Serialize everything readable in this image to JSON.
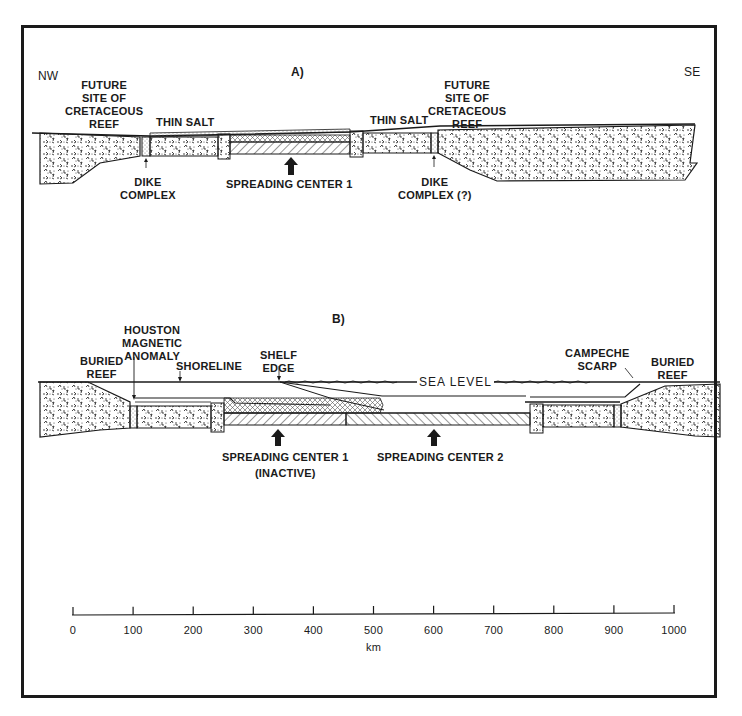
{
  "figure": {
    "orientation": {
      "left": "NW",
      "right": "SE"
    },
    "panel_a": {
      "title": "A)",
      "labels": {
        "reef_left": "FUTURE\nSITE OF\nCRETACEOUS\nREEF",
        "thin_salt_left": "THIN SALT",
        "dike_left": "DIKE\nCOMPLEX",
        "spreading_center": "SPREADING CENTER 1",
        "thin_salt_right": "THIN SALT",
        "reef_right": "FUTURE\nSITE OF\nCRETACEOUS\nREEF",
        "dike_right": "DIKE\nCOMPLEX (?)"
      }
    },
    "panel_b": {
      "title": "B)",
      "labels": {
        "buried_reef_left": "BURIED\nREEF",
        "houston_anomaly": "HOUSTON\nMAGNETIC\nANOMALY",
        "shoreline": "SHORELINE",
        "shelf_edge": "SHELF\nEDGE",
        "sea_level": "SEA LEVEL",
        "campeche_scarp": "CAMPECHE\nSCARP",
        "buried_reef_right": "BURIED\nREEF",
        "spreading_center_1": "SPREADING CENTER 1",
        "spreading_center_1_note": "(INACTIVE)",
        "spreading_center_2": "SPREADING CENTER 2"
      }
    },
    "scale_bar": {
      "unit": "km",
      "ticks": [
        "0",
        "100",
        "200",
        "300",
        "400",
        "500",
        "600",
        "700",
        "800",
        "900",
        "1000"
      ]
    },
    "colors": {
      "ink": "#1a1a1a",
      "paper": "#ffffff"
    }
  }
}
